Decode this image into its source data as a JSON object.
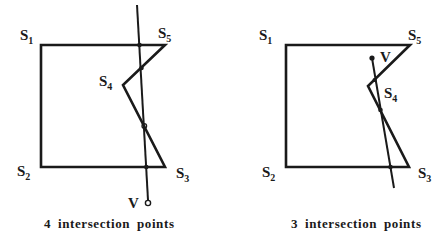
{
  "figures": [
    {
      "id": "left",
      "caption": "4 intersection points",
      "labels": {
        "s1": {
          "main": "S",
          "sub": "1"
        },
        "s2": {
          "main": "S",
          "sub": "2"
        },
        "s3": {
          "main": "S",
          "sub": "3"
        },
        "s4": {
          "main": "S",
          "sub": "4"
        },
        "s5": {
          "main": "S",
          "sub": "5"
        },
        "v": "V"
      },
      "intersection_count": 4
    },
    {
      "id": "right",
      "caption": "3 intersection points",
      "labels": {
        "s1": {
          "main": "S",
          "sub": "1"
        },
        "s2": {
          "main": "S",
          "sub": "2"
        },
        "s3": {
          "main": "S",
          "sub": "3"
        },
        "s4": {
          "main": "S",
          "sub": "4"
        },
        "s5": {
          "main": "S",
          "sub": "5"
        },
        "v": "V"
      },
      "intersection_count": 3
    }
  ],
  "colors": {
    "stroke": "#1a1a1a",
    "background": "#ffffff"
  }
}
